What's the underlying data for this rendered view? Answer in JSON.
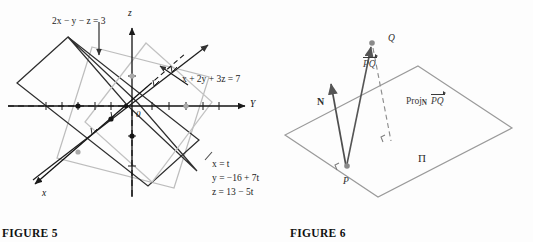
{
  "figures": [
    {
      "id": "figure-5",
      "caption": "FIGURE 5",
      "axes": {
        "x_label": "x",
        "y_label": "Y",
        "z_label": "z",
        "origin_label": "0"
      },
      "plane_labels": [
        {
          "id": "plane-dark",
          "text": "2x − y − z = 3"
        },
        {
          "id": "plane-light",
          "text": "x + 2y + 3z = 7"
        }
      ],
      "parametric": {
        "lines": [
          "x = t",
          "y = −16 + 7t",
          "z = 13 − 5t"
        ]
      },
      "colors": {
        "dark_plane": "#2b2b2b",
        "light_plane": "#b9b9b9",
        "axis": "#111111",
        "intersection_line": "#1e1e1e"
      }
    },
    {
      "id": "figure-6",
      "caption": "FIGURE 6",
      "plane_name": "Π",
      "points": [
        {
          "id": "point-p",
          "label": "P"
        },
        {
          "id": "point-q",
          "label": "Q"
        }
      ],
      "vectors": [
        {
          "id": "vector-n",
          "label": "N"
        },
        {
          "id": "vector-pq",
          "label": "PQ",
          "accent": "arrow"
        },
        {
          "id": "vector-projection",
          "label_prefix": "Proj",
          "label_sub": "N",
          "label_vector": "PQ"
        }
      ],
      "colors": {
        "plane_outline": "#9a9a9a",
        "vector": "#555555",
        "dashed": "#8a8a8a",
        "text": "#2a2a2a"
      }
    }
  ]
}
